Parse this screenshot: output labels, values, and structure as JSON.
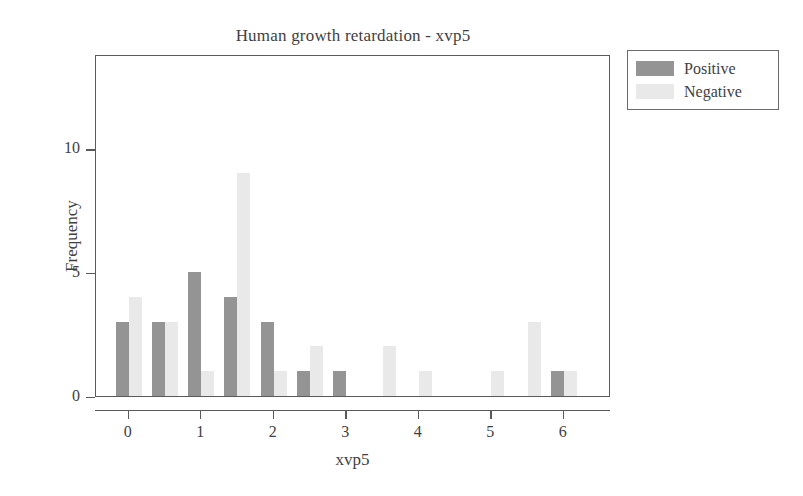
{
  "chart_data": {
    "type": "bar",
    "title": "Human growth retardation - xvp5",
    "xlabel": "xvp5",
    "ylabel": "Frequency",
    "xlim": [
      -0.45,
      6.65
    ],
    "ylim": [
      0,
      13.8
    ],
    "xticks": [
      0,
      1,
      2,
      3,
      4,
      5,
      6
    ],
    "xtick_labels": [
      "0",
      "1",
      "2",
      "3",
      "4",
      "5",
      "6"
    ],
    "yticks": [
      0,
      5,
      10
    ],
    "ytick_labels": [
      "0",
      "5",
      "10"
    ],
    "grid": false,
    "legend_position": "upper right",
    "bar_width": 0.18,
    "series": [
      {
        "name": "Positive",
        "color": "#949494",
        "x": [
          0,
          0.5,
          1,
          1.5,
          2,
          2.5,
          3,
          6
        ],
        "values": [
          3,
          3,
          5,
          4,
          3,
          1,
          1,
          1
        ]
      },
      {
        "name": "Negative",
        "color": "#e9e9e9",
        "x": [
          0,
          0.5,
          1,
          1.5,
          2,
          2.5,
          3.5,
          4,
          5,
          5.5,
          6
        ],
        "values": [
          4,
          3,
          1,
          9,
          1,
          2,
          2,
          1,
          1,
          3,
          1
        ]
      }
    ]
  },
  "legend": {
    "items": [
      {
        "label": "Positive",
        "color": "#949494"
      },
      {
        "label": "Negative",
        "color": "#e9e9e9"
      }
    ]
  }
}
